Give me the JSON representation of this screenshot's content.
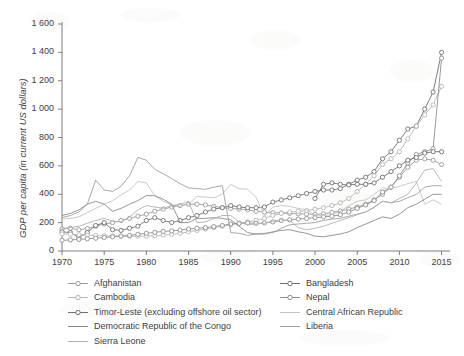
{
  "chart_data": {
    "type": "line",
    "title": "",
    "xlabel": "",
    "ylabel": "GDP per capita (in current US dollars)",
    "xlim": [
      1970,
      2016
    ],
    "ylim": [
      0,
      1600
    ],
    "xticks": [
      "1970",
      "1975",
      "1980",
      "1985",
      "1990",
      "1995",
      "2000",
      "2005",
      "2010",
      "2015"
    ],
    "yticks": [
      "0",
      "200",
      "400",
      "600",
      "800",
      "1 000",
      "1 200",
      "1 400",
      "1 600"
    ],
    "grid": false,
    "legend_position": "below-axes",
    "x": [
      1970,
      1971,
      1972,
      1973,
      1974,
      1975,
      1976,
      1977,
      1978,
      1979,
      1980,
      1981,
      1982,
      1983,
      1984,
      1985,
      1986,
      1987,
      1988,
      1989,
      1990,
      1991,
      1992,
      1993,
      1994,
      1995,
      1996,
      1997,
      1998,
      1999,
      2000,
      2001,
      2002,
      2003,
      2004,
      2005,
      2006,
      2007,
      2008,
      2009,
      2010,
      2011,
      2012,
      2013,
      2014,
      2015
    ],
    "series": [
      {
        "name": "Afghanistan",
        "marker": "circle",
        "color": "#9a9a9a",
        "values": [
          155,
          160,
          150,
          158,
          175,
          190,
          200,
          215,
          230,
          245,
          260,
          280,
          295,
          310,
          320,
          330,
          330,
          325,
          315,
          305,
          300,
          295,
          290,
          280,
          275,
          270,
          268,
          265,
          262,
          260,
          258,
          262,
          272,
          282,
          295,
          310,
          330,
          360,
          400,
          450,
          520,
          590,
          640,
          650,
          640,
          610
        ]
      },
      {
        "name": "Bangladesh",
        "marker": "circle",
        "color": "#707070",
        "values": [
          135,
          130,
          95,
          130,
          180,
          200,
          150,
          145,
          160,
          175,
          215,
          235,
          215,
          200,
          215,
          235,
          250,
          275,
          295,
          305,
          320,
          310,
          305,
          305,
          310,
          345,
          360,
          375,
          390,
          405,
          420,
          430,
          430,
          440,
          470,
          500,
          520,
          560,
          650,
          700,
          780,
          860,
          880,
          1000,
          1120,
          1400
        ]
      },
      {
        "name": "Cambodia",
        "marker": "circle",
        "color": "#b5b5b5",
        "values": [
          120,
          118,
          115,
          112,
          110,
          108,
          106,
          105,
          104,
          104,
          105,
          108,
          112,
          118,
          125,
          135,
          145,
          155,
          165,
          175,
          185,
          195,
          205,
          215,
          230,
          250,
          265,
          275,
          280,
          285,
          295,
          305,
          320,
          340,
          370,
          420,
          470,
          530,
          610,
          650,
          700,
          790,
          880,
          960,
          1030,
          1160
        ]
      },
      {
        "name": "Nepal",
        "marker": "circle",
        "color": "#8e8e8e",
        "values": [
          75,
          78,
          82,
          86,
          90,
          95,
          100,
          105,
          110,
          118,
          125,
          132,
          138,
          142,
          148,
          155,
          160,
          165,
          172,
          180,
          190,
          195,
          198,
          195,
          198,
          205,
          215,
          220,
          225,
          230,
          235,
          240,
          245,
          255,
          275,
          300,
          325,
          355,
          415,
          450,
          530,
          620,
          680,
          700,
          720,
          1360
        ]
      },
      {
        "name": "Timor-Leste (excluding offshore oil sector)",
        "marker": "circle",
        "color": "#6e6e6e",
        "values": [
          null,
          null,
          null,
          null,
          null,
          null,
          null,
          null,
          null,
          null,
          null,
          null,
          null,
          null,
          null,
          null,
          null,
          null,
          null,
          null,
          null,
          null,
          null,
          null,
          null,
          null,
          null,
          null,
          null,
          null,
          370,
          470,
          480,
          470,
          465,
          470,
          470,
          480,
          520,
          560,
          600,
          640,
          660,
          690,
          700,
          700
        ]
      },
      {
        "name": "Central African Republic",
        "marker": "none",
        "color": "#c3c3c3",
        "values": [
          225,
          230,
          240,
          270,
          300,
          330,
          355,
          395,
          430,
          490,
          480,
          390,
          350,
          325,
          315,
          330,
          385,
          380,
          375,
          400,
          470,
          440,
          435,
          380,
          245,
          310,
          320,
          315,
          300,
          290,
          255,
          250,
          255,
          280,
          320,
          350,
          360,
          400,
          445,
          440,
          455,
          475,
          490,
          330,
          360,
          330
        ]
      },
      {
        "name": "Democratic Republic of the Congo",
        "marker": "none",
        "color": "#8a8a8a",
        "values": [
          250,
          265,
          290,
          330,
          350,
          330,
          280,
          300,
          330,
          355,
          390,
          390,
          365,
          330,
          200,
          200,
          230,
          230,
          235,
          230,
          220,
          175,
          130,
          120,
          120,
          135,
          145,
          150,
          135,
          125,
          105,
          100,
          110,
          120,
          135,
          165,
          190,
          215,
          240,
          230,
          260,
          305,
          330,
          365,
          400,
          400
        ]
      },
      {
        "name": "Liberia",
        "marker": "none",
        "color": "#9f9f9f",
        "values": [
          235,
          250,
          275,
          330,
          500,
          430,
          420,
          455,
          530,
          660,
          640,
          575,
          545,
          510,
          475,
          445,
          440,
          435,
          450,
          460,
          130,
          125,
          110,
          120,
          125,
          130,
          160,
          185,
          190,
          195,
          200,
          215,
          225,
          230,
          245,
          260,
          275,
          310,
          350,
          340,
          350,
          375,
          400,
          450,
          460,
          460
        ]
      },
      {
        "name": "Sierra Leone",
        "marker": "none",
        "color": "#b0b0b0",
        "values": [
          160,
          165,
          175,
          195,
          215,
          230,
          210,
          205,
          240,
          290,
          320,
          310,
          300,
          320,
          330,
          350,
          200,
          205,
          230,
          250,
          250,
          205,
          185,
          190,
          195,
          210,
          220,
          215,
          165,
          150,
          160,
          175,
          195,
          215,
          235,
          255,
          275,
          305,
          350,
          340,
          370,
          400,
          480,
          570,
          580,
          490
        ]
      }
    ]
  },
  "legend": {
    "left_column": [
      {
        "label": "Afghanistan",
        "marker": "circle"
      },
      {
        "label": "Cambodia",
        "marker": "circle"
      },
      {
        "label": "Timor-Leste (excluding offshore oil sector)",
        "marker": "circle"
      },
      {
        "label": "Democratic Republic of the Congo",
        "marker": "none"
      },
      {
        "label": "Sierra Leone",
        "marker": "none"
      }
    ],
    "right_column": [
      {
        "label": "Bangladesh",
        "marker": "circle"
      },
      {
        "label": "Nepal",
        "marker": "circle"
      },
      {
        "label": "Central African Republic",
        "marker": "none"
      },
      {
        "label": "Liberia",
        "marker": "none"
      }
    ]
  }
}
